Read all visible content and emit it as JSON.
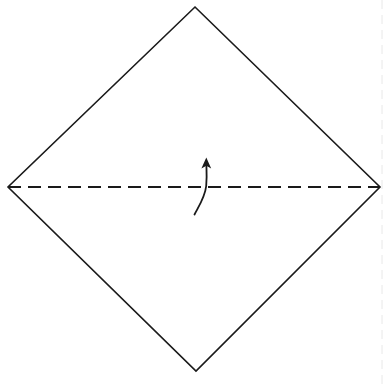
{
  "figure": {
    "caption": "Square sheet rotated 45 degrees with horizontal valley-fold crease and upward fold arrow",
    "background_color": "#ffffff",
    "canvas": {
      "width": 387,
      "height": 387
    }
  },
  "paper": {
    "name": "square-sheet-diamond",
    "shape": "diamond",
    "fill_color": "#ffffff",
    "stroke_color": "#1a1a1a",
    "stroke_width": 1.6,
    "vertices": [
      {
        "label": "top",
        "x": 195,
        "y": 7
      },
      {
        "label": "right",
        "x": 380,
        "y": 187
      },
      {
        "label": "bottom",
        "x": 196,
        "y": 371
      },
      {
        "label": "left",
        "x": 8,
        "y": 187
      }
    ],
    "points_attr": "195,7 380,187 196,371 8,187"
  },
  "crease": {
    "name": "valley-fold-crease",
    "type": "dashed",
    "meaning": "valley fold line",
    "color": "#1a1a1a",
    "stroke_width": 2.2,
    "dash_pattern": "13 7",
    "x1": 8,
    "y1": 187,
    "x2": 380,
    "y2": 187
  },
  "arrow": {
    "name": "fold-direction-arrow",
    "meaning": "fold bottom half up along crease",
    "color": "#1a1a1a",
    "shaft_width": 1.8,
    "shaft_path": "M 194.5 214.5 C 199.5 205 205 197 206.2 186 C 207 177 206.6 171 206.4 166",
    "head_points": "206.3 157.5 211.2 168.5 206.3 165.8 201.4 168.5",
    "tip": {
      "x": 206,
      "y": 158
    },
    "tail": {
      "x": 194,
      "y": 215
    }
  },
  "artifact": {
    "name": "scan-edge-line",
    "visible": true,
    "color": "#e8e8e8",
    "stroke_width": 1,
    "dash_pattern": "9 6",
    "x": 382,
    "y1": 0,
    "y2": 387
  }
}
